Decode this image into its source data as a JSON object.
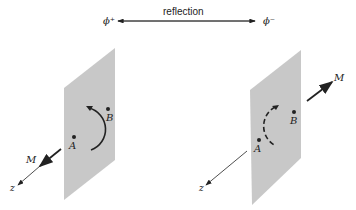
{
  "header": {
    "left_state": "ϕ⁺",
    "right_state": "ϕ⁻",
    "relation_label": "reflection"
  },
  "left_panel": {
    "point_a": "A",
    "point_b": "B",
    "vector_label": "M",
    "axis_label": "z",
    "arc_style": "solid"
  },
  "right_panel": {
    "point_a": "A",
    "point_b": "B",
    "vector_label": "M",
    "axis_label": "z",
    "arc_style": "dashed"
  },
  "colors": {
    "plane": "#c8c8c8",
    "ink": "#222222"
  }
}
